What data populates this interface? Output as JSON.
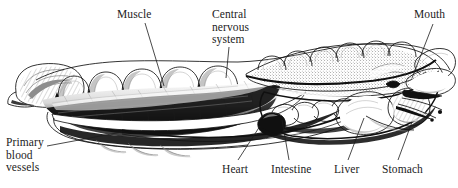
{
  "figure": {
    "background_color": "#ffffff",
    "ink_color": "#101010",
    "text_color": "#1c1c1c",
    "orientation": "tail at left, head and mouth at right",
    "style": "black-and-white engraved scientific illustration"
  },
  "labels": {
    "muscle": "Muscle",
    "cns_line1": "Central",
    "cns_line2": "nervous",
    "cns_line3": "system",
    "mouth": "Mouth",
    "pbv_line1": "Primary",
    "pbv_line2": "blood",
    "pbv_line3": "vessels",
    "heart": "Heart",
    "intestine": "Intestine",
    "liver": "Liver",
    "stomach": "Stomach"
  },
  "callouts": [
    {
      "name": "muscle",
      "text": "Muscle",
      "position": "top",
      "leader": "down-right"
    },
    {
      "name": "central-nervous-system",
      "text": "Central nervous system",
      "position": "top",
      "leader": "down"
    },
    {
      "name": "mouth",
      "text": "Mouth",
      "position": "top",
      "leader": "down-left"
    },
    {
      "name": "primary-blood-vessels",
      "text": "Primary blood vessels",
      "position": "left",
      "leader": "right"
    },
    {
      "name": "heart",
      "text": "Heart",
      "position": "bottom",
      "leader": "up-right"
    },
    {
      "name": "intestine",
      "text": "Intestine",
      "position": "bottom",
      "leader": "up-left"
    },
    {
      "name": "liver",
      "text": "Liver",
      "position": "bottom",
      "leader": "up-left"
    },
    {
      "name": "stomach",
      "text": "Stomach",
      "position": "bottom",
      "leader": "up-left"
    }
  ]
}
